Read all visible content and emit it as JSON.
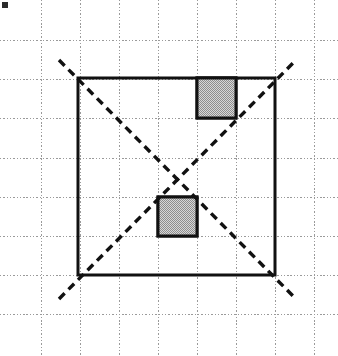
{
  "figure": {
    "canvas": {
      "width": 338,
      "height": 356,
      "background": "#ffffff"
    },
    "colors": {
      "grid": "#9a9a9a",
      "stroke": "#111111",
      "shade_fill": "#b2b2b2",
      "marker": "#2b2b2b",
      "background": "#ffffff"
    },
    "grid": {
      "label": "Dotted graph paper grid",
      "spacing_px": 39.3,
      "x_positions": [
        41,
        80,
        119,
        158,
        197,
        236,
        275,
        314
      ],
      "y_positions": [
        40,
        79,
        118,
        158,
        197,
        236,
        275,
        314
      ],
      "style": "dotted",
      "stroke_width": 1
    },
    "outer_square": {
      "label": "Large outlined square",
      "x": 78,
      "y": 78,
      "width": 197,
      "height": 197,
      "cells_wide": 5,
      "cells_tall": 5,
      "stroke_width": 3
    },
    "shaded_squares": [
      {
        "label": "Upper shaded unit square",
        "position": "top, fourth column from left, first row",
        "x": 197,
        "y": 78,
        "width": 39,
        "height": 40,
        "cells": 1
      },
      {
        "label": "Lower shaded unit square",
        "position": "third column from left, fourth row",
        "x": 158,
        "y": 197,
        "width": 39,
        "height": 39,
        "cells": 1
      }
    ],
    "diagonals": [
      {
        "label": "Descending dashed diagonal",
        "direction": "top-left to bottom-right",
        "x1": 59,
        "y1": 60,
        "x2": 296,
        "y2": 299
      },
      {
        "label": "Ascending dashed diagonal",
        "direction": "bottom-left to top-right",
        "x1": 59,
        "y1": 299,
        "x2": 296,
        "y2": 60
      }
    ],
    "intersection": {
      "label": "Diagonal crossing point at square center",
      "x": 176,
      "y": 176
    },
    "corner_marker": {
      "label": "Small dark marker blob",
      "x": 2,
      "y": 2,
      "width": 6,
      "height": 6
    }
  }
}
